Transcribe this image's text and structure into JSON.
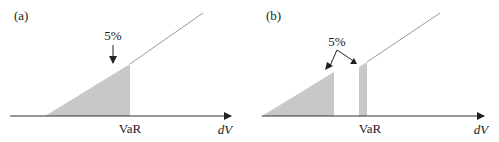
{
  "figure": {
    "type": "diagram",
    "colors": {
      "shade": "#c8c8c8",
      "axis": "#333333",
      "curve": "#9a9a9a",
      "text": "#1a1a1a"
    },
    "panels": [
      {
        "label": "(a)",
        "percent_label": "5%",
        "var_label": "VaR",
        "x_axis_label_prefix": "d",
        "x_axis_label_var": "V"
      },
      {
        "label": "(b)",
        "percent_label": "5%",
        "var_label": "VaR",
        "x_axis_label_prefix": "d",
        "x_axis_label_var": "V"
      }
    ]
  }
}
